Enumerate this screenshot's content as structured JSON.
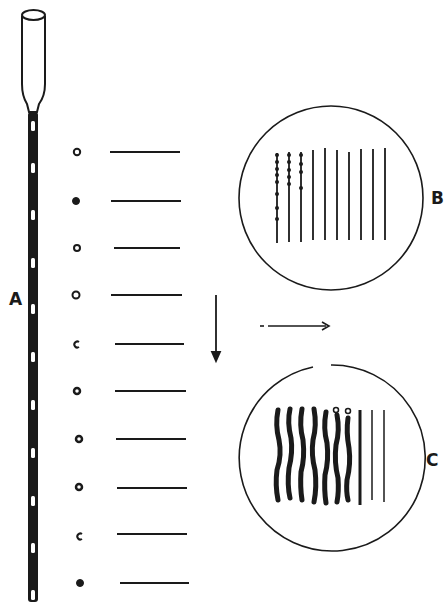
{
  "figure": {
    "labels": {
      "tube": "A",
      "view_top": "B",
      "view_bottom": "C"
    },
    "ink_color": "#1a1a1a",
    "background": "#ffffff"
  },
  "tube_A": {
    "opening_count": 10,
    "description": "Long capillary tube with flared open top and a row of slit openings along its shaft"
  },
  "row_samples": {
    "count": 10,
    "markers": [
      "ring",
      "filled-dot",
      "ring",
      "ring",
      "open-c",
      "ring-dense",
      "ring-dense",
      "ring-dense",
      "open-c",
      "filled-dot"
    ]
  },
  "view_B": {
    "line_count": 10,
    "beaded_lines": 3
  },
  "view_C": {
    "line_count": 10,
    "thick_wavy_lines": 7,
    "ringed_tops": 2,
    "thin_lines": 2
  },
  "arrows": {
    "down": "down-arrow",
    "right": "right-arrow"
  }
}
